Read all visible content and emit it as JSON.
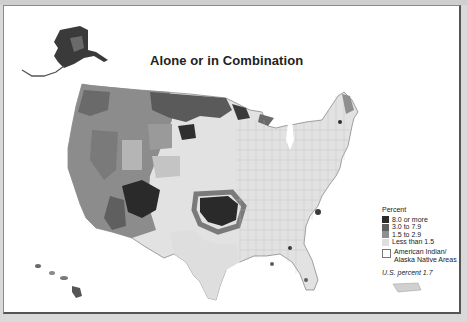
{
  "title": "Alone or in Combination",
  "legend": {
    "header": "Percent",
    "classes": [
      {
        "label": "8.0 or more",
        "color": "#2a2a2a"
      },
      {
        "label": "3.0 to 7.9",
        "color": "#5f5f5f"
      },
      {
        "label": "1.5 to 2.9",
        "color": "#8f8f8f"
      },
      {
        "label": "Less than 1.5",
        "color": "#dedede"
      }
    ],
    "ai_areas_label_1": "American Indian/",
    "ai_areas_label_2": "Alaska Native Areas",
    "us_note": "U.S. percent 1.7"
  },
  "regions": {
    "alaska": "Alaska",
    "hawaii": "Hawaii",
    "puerto_rico": "Puerto Rico",
    "conterminous": "Conterminous United States"
  }
}
